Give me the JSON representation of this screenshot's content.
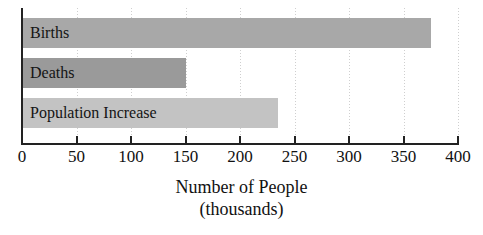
{
  "chart_data": {
    "type": "bar",
    "orientation": "horizontal",
    "title": "",
    "xlabel": "Number of People",
    "xlabel_sub": "(thousands)",
    "ylabel": "",
    "categories": [
      "Births",
      "Deaths",
      "Population Increase"
    ],
    "values": [
      375,
      150,
      235
    ],
    "xlim": [
      0,
      400
    ],
    "xticks": [
      0,
      50,
      100,
      150,
      200,
      250,
      300,
      350,
      400
    ],
    "xtick_labels": [
      "0",
      "50",
      "100",
      "150",
      "200",
      "250",
      "300",
      "350",
      "400"
    ],
    "grid": true,
    "legend": "none",
    "bar_colors": [
      "#a8a8a8",
      "#9a9a9a",
      "#c3c3c3"
    ],
    "axis_color": "#222222",
    "gridline_color": "#cfcfcf",
    "background": "#ffffff"
  },
  "bars": [
    {
      "label": "Births",
      "value": 375,
      "color": "#a8a8a8"
    },
    {
      "label": "Deaths",
      "value": 150,
      "color": "#9a9a9a"
    },
    {
      "label": "Population Increase",
      "value": 235,
      "color": "#c3c3c3"
    }
  ],
  "axis": {
    "ticks": [
      {
        "value": 0,
        "label": "0"
      },
      {
        "value": 50,
        "label": "50"
      },
      {
        "value": 100,
        "label": "100"
      },
      {
        "value": 150,
        "label": "150"
      },
      {
        "value": 200,
        "label": "200"
      },
      {
        "value": 250,
        "label": "250"
      },
      {
        "value": 300,
        "label": "300"
      },
      {
        "value": 350,
        "label": "350"
      },
      {
        "value": 400,
        "label": "400"
      }
    ],
    "title_line1": "Number of People",
    "title_line2": "(thousands)"
  }
}
